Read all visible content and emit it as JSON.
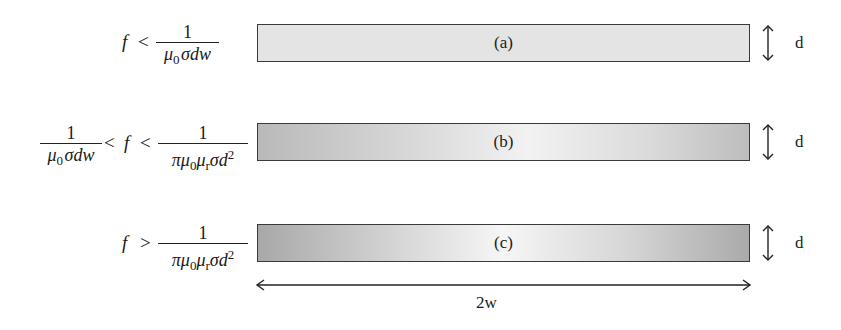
{
  "diagram": {
    "rows": [
      {
        "id": "a",
        "label": "(a)",
        "condition": {
          "type": "lt",
          "variable": "f",
          "op1": "<",
          "upper_fraction": {
            "numerator": "1",
            "denominator_parts": [
              "μ",
              "0",
              "σdw"
            ]
          }
        },
        "shading": "uniform"
      },
      {
        "id": "b",
        "label": "(b)",
        "condition": {
          "type": "between",
          "lower_fraction": {
            "numerator": "1",
            "denominator_parts": [
              "μ",
              "0",
              "σdw"
            ]
          },
          "op1": "<",
          "variable": "f",
          "op2": "<",
          "upper_fraction": {
            "numerator": "1",
            "denominator_parts": [
              "πμ",
              "0",
              "μ",
              "r",
              "σd",
              "2"
            ]
          }
        },
        "shading": "edge-darkened"
      },
      {
        "id": "c",
        "label": "(c)",
        "condition": {
          "type": "gt",
          "variable": "f",
          "op1": ">",
          "lower_fraction": {
            "numerator": "1",
            "denominator_parts": [
              "πμ",
              "0",
              "μ",
              "r",
              "σd",
              "2"
            ]
          }
        },
        "shading": "strong-edge-darkened"
      }
    ],
    "thickness_label": "d",
    "width_label": "2w",
    "colors": {
      "bar_border": "#3a3a3a",
      "bar_a_fill": "#e4e4e4",
      "bar_edge_dark": "#a8a8a8",
      "bar_center_light": "#f6f6f6"
    }
  }
}
